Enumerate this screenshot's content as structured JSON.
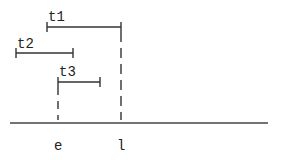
{
  "diagram": {
    "intervals": [
      {
        "label": "t1",
        "x1": 47,
        "x2": 121,
        "y": 27
      },
      {
        "label": "t2",
        "x1": 16,
        "x2": 73,
        "y": 53
      },
      {
        "label": "t3",
        "x1": 58,
        "x2": 100,
        "y": 82
      }
    ],
    "markers": [
      {
        "label": "e",
        "x": 58
      },
      {
        "label": "l",
        "x": 121
      }
    ],
    "axis": {
      "x1": 10,
      "x2": 268,
      "y": 123
    },
    "colors": {
      "line": "#333333",
      "text": "#222222"
    }
  }
}
